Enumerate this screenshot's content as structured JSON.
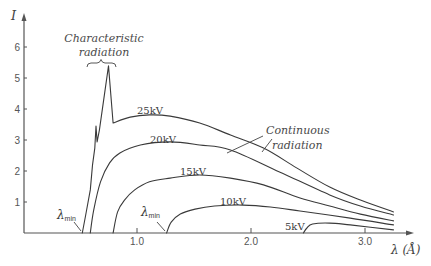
{
  "chart_data": {
    "type": "line",
    "title": "",
    "xlabel": "λ (Å)",
    "ylabel": "I",
    "xlim": [
      0,
      3.4
    ],
    "ylim": [
      0,
      6.5
    ],
    "grid": false,
    "x_ticks": [
      "1.0",
      "2.0",
      "3.0"
    ],
    "y_ticks": [
      "1",
      "2",
      "3",
      "4",
      "5",
      "6"
    ],
    "colors": {
      "line": "#3a3a3a",
      "text": "#444444",
      "background": "#ffffff"
    },
    "series": [
      {
        "name": "25kV",
        "lambda_min": 0.52,
        "sharp_until": 9,
        "points": [
          [
            0.52,
            0
          ],
          [
            0.55,
            0.58
          ],
          [
            0.59,
            1.39
          ],
          [
            0.61,
            2.19
          ],
          [
            0.63,
            2.74
          ],
          [
            0.64,
            3.45
          ],
          [
            0.65,
            2.94
          ],
          [
            0.67,
            3.32
          ],
          [
            0.75,
            5.39
          ],
          [
            0.79,
            3.55
          ],
          [
            0.94,
            3.74
          ],
          [
            1.11,
            3.81
          ],
          [
            1.29,
            3.77
          ],
          [
            1.55,
            3.55
          ],
          [
            1.82,
            3.16
          ],
          [
            2.11,
            2.74
          ],
          [
            2.4,
            2.1
          ],
          [
            2.69,
            1.48
          ],
          [
            2.96,
            1.06
          ],
          [
            3.25,
            0.68
          ]
        ]
      },
      {
        "name": "20kV",
        "lambda_min": 0.59,
        "sharp_until": 0,
        "points": [
          [
            0.59,
            0
          ],
          [
            0.62,
            0.74
          ],
          [
            0.68,
            1.65
          ],
          [
            0.76,
            2.26
          ],
          [
            0.85,
            2.58
          ],
          [
            1.03,
            2.84
          ],
          [
            1.29,
            2.94
          ],
          [
            1.55,
            2.84
          ],
          [
            1.82,
            2.68
          ],
          [
            2.25,
            1.97
          ],
          [
            2.69,
            1.23
          ],
          [
            2.96,
            0.87
          ],
          [
            3.25,
            0.58
          ]
        ]
      },
      {
        "name": "15kV",
        "lambda_min": 0.79,
        "sharp_until": 0,
        "points": [
          [
            0.79,
            0
          ],
          [
            0.83,
            0.68
          ],
          [
            0.89,
            1.06
          ],
          [
            0.98,
            1.39
          ],
          [
            1.11,
            1.65
          ],
          [
            1.29,
            1.77
          ],
          [
            1.55,
            1.87
          ],
          [
            1.82,
            1.77
          ],
          [
            2.11,
            1.55
          ],
          [
            2.43,
            1.13
          ],
          [
            2.69,
            0.87
          ],
          [
            2.96,
            0.61
          ],
          [
            3.25,
            0.39
          ]
        ]
      },
      {
        "name": "10kV",
        "lambda_min": 1.26,
        "sharp_until": 0,
        "points": [
          [
            1.26,
            0
          ],
          [
            1.3,
            0.35
          ],
          [
            1.38,
            0.61
          ],
          [
            1.51,
            0.77
          ],
          [
            1.68,
            0.87
          ],
          [
            1.93,
            0.9
          ],
          [
            2.17,
            0.84
          ],
          [
            2.43,
            0.71
          ],
          [
            2.87,
            0.48
          ],
          [
            3.25,
            0.26
          ]
        ]
      },
      {
        "name": "5kV",
        "lambda_min": 2.46,
        "sharp_until": 0,
        "points": [
          [
            2.46,
            0
          ],
          [
            2.49,
            0.16
          ],
          [
            2.54,
            0.29
          ],
          [
            2.69,
            0.32
          ],
          [
            2.87,
            0.26
          ],
          [
            3.25,
            0.1
          ]
        ]
      }
    ],
    "characteristic_peaks": [
      {
        "label": "Kβ",
        "lambda": 0.64,
        "I": 3.45
      },
      {
        "label": "Kα",
        "lambda": 0.75,
        "I": 5.39
      }
    ],
    "annotations": {
      "characteristic": {
        "line1": "Characteristic",
        "line2": "radiation"
      },
      "continuous": {
        "line1": "Continuous",
        "line2": "radiation"
      },
      "lambda_min_symbol": "λ",
      "lambda_min_subscript": "min",
      "curve_labels": [
        "25kV",
        "20kV",
        "15kV",
        "10kV",
        "5kV"
      ]
    }
  }
}
